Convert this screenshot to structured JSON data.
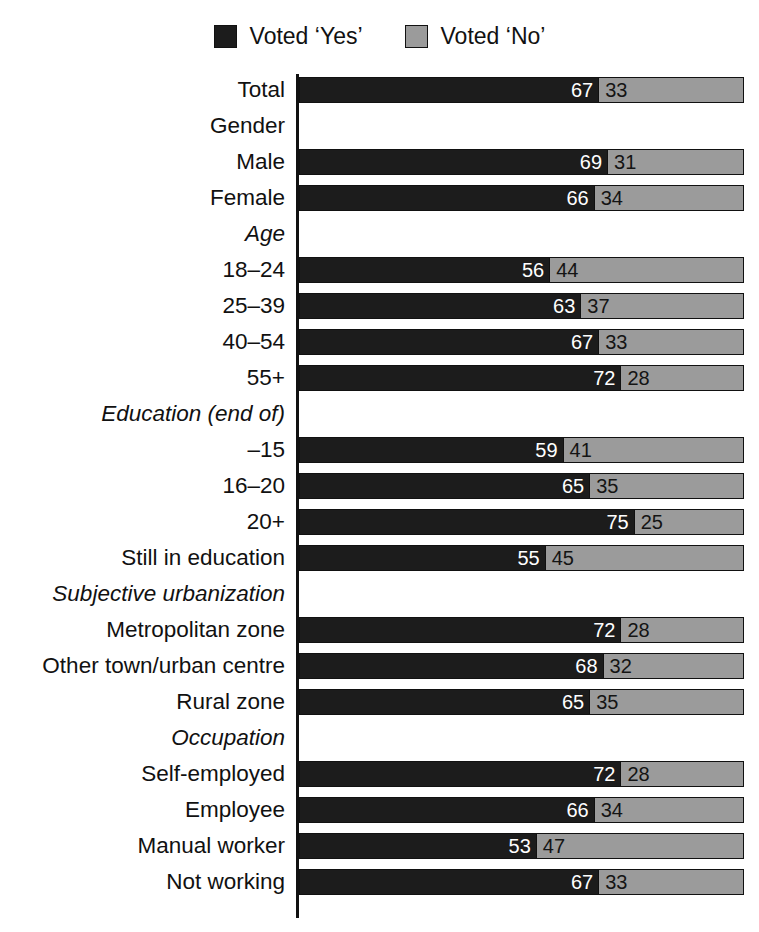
{
  "legend": {
    "entries": [
      {
        "label": "Voted ‘Yes’",
        "key": "yes",
        "color": "#1c1c1c"
      },
      {
        "label": "Voted ‘No’",
        "key": "no",
        "color": "#9b9b9b"
      }
    ]
  },
  "colors": {
    "yes": "#1c1c1c",
    "no": "#9b9b9b",
    "axis": "#111111",
    "background": "#ffffff",
    "yes_label_text": "#ffffff",
    "no_label_text": "#141414"
  },
  "chart_data": {
    "type": "bar",
    "subtype": "stacked-horizontal-100",
    "title": "",
    "subtitle": "",
    "xlabel": "",
    "ylabel": "",
    "xlim": [
      0,
      100
    ],
    "grid": false,
    "legend_position": "top-center",
    "legend_entries": [
      "Voted ‘Yes’",
      "Voted ‘No’"
    ],
    "series": [
      {
        "name": "Voted ‘Yes’",
        "color": "#1c1c1c",
        "values": [
          67,
          null,
          69,
          66,
          null,
          56,
          63,
          67,
          72,
          null,
          59,
          65,
          75,
          55,
          null,
          72,
          68,
          65,
          null,
          72,
          66,
          53,
          67
        ]
      },
      {
        "name": "Voted ‘No’",
        "color": "#9b9b9b",
        "values": [
          33,
          null,
          31,
          34,
          null,
          44,
          37,
          33,
          28,
          null,
          41,
          35,
          25,
          45,
          null,
          28,
          32,
          35,
          null,
          28,
          34,
          47,
          33
        ]
      }
    ],
    "categories": [
      "Total",
      "Gender",
      "Male",
      "Female",
      "Age",
      "18–24",
      "25–39",
      "40–54",
      "55+",
      "Education (end of)",
      "–15",
      "16–20",
      "20+",
      "Still in education",
      "Subjective urbanization",
      "Metropolitan zone",
      "Other town/urban centre",
      "Rural zone",
      "Occupation",
      "Self-employed",
      "Employee",
      "Manual worker",
      "Not working"
    ]
  },
  "rows": [
    {
      "label": "Total",
      "header": false,
      "italic": false,
      "yes": 67,
      "no": 33
    },
    {
      "label": "Gender",
      "header": true,
      "italic": false,
      "yes": null,
      "no": null
    },
    {
      "label": "Male",
      "header": false,
      "italic": false,
      "yes": 69,
      "no": 31
    },
    {
      "label": "Female",
      "header": false,
      "italic": false,
      "yes": 66,
      "no": 34
    },
    {
      "label": "Age",
      "header": true,
      "italic": true,
      "yes": null,
      "no": null
    },
    {
      "label": "18–24",
      "header": false,
      "italic": false,
      "yes": 56,
      "no": 44
    },
    {
      "label": "25–39",
      "header": false,
      "italic": false,
      "yes": 63,
      "no": 37
    },
    {
      "label": "40–54",
      "header": false,
      "italic": false,
      "yes": 67,
      "no": 33
    },
    {
      "label": "55+",
      "header": false,
      "italic": false,
      "yes": 72,
      "no": 28
    },
    {
      "label": "Education (end of)",
      "header": true,
      "italic": true,
      "yes": null,
      "no": null
    },
    {
      "label": "–15",
      "header": false,
      "italic": false,
      "yes": 59,
      "no": 41
    },
    {
      "label": "16–20",
      "header": false,
      "italic": false,
      "yes": 65,
      "no": 35
    },
    {
      "label": "20+",
      "header": false,
      "italic": false,
      "yes": 75,
      "no": 25
    },
    {
      "label": "Still in education",
      "header": false,
      "italic": false,
      "yes": 55,
      "no": 45
    },
    {
      "label": "Subjective urbanization",
      "header": true,
      "italic": true,
      "yes": null,
      "no": null
    },
    {
      "label": "Metropolitan zone",
      "header": false,
      "italic": false,
      "yes": 72,
      "no": 28
    },
    {
      "label": "Other town/urban centre",
      "header": false,
      "italic": false,
      "yes": 68,
      "no": 32
    },
    {
      "label": "Rural zone",
      "header": false,
      "italic": false,
      "yes": 65,
      "no": 35
    },
    {
      "label": "Occupation",
      "header": true,
      "italic": true,
      "yes": null,
      "no": null
    },
    {
      "label": "Self-employed",
      "header": false,
      "italic": false,
      "yes": 72,
      "no": 28
    },
    {
      "label": "Employee",
      "header": false,
      "italic": false,
      "yes": 66,
      "no": 34
    },
    {
      "label": "Manual worker",
      "header": false,
      "italic": false,
      "yes": 53,
      "no": 47
    },
    {
      "label": "Not working",
      "header": false,
      "italic": false,
      "yes": 67,
      "no": 33
    }
  ]
}
